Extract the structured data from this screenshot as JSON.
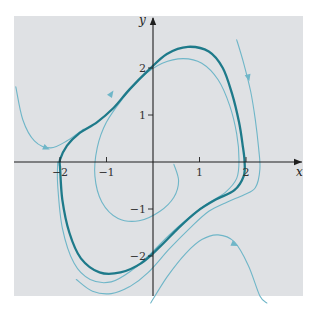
{
  "figure": {
    "type": "phase-portrait",
    "x_axis_label": "x",
    "y_axis_label": "y",
    "x_range": [
      -3,
      3.1
    ],
    "y_range": [
      -3,
      3
    ],
    "x_ticks": [
      {
        "value": -2,
        "label": "−2"
      },
      {
        "value": -1,
        "label": "−1"
      },
      {
        "value": 1,
        "label": "1"
      },
      {
        "value": 2,
        "label": "2"
      }
    ],
    "y_ticks": [
      {
        "value": 2,
        "label": "2"
      },
      {
        "value": 1,
        "label": "1"
      },
      {
        "value": -1,
        "label": "−1"
      },
      {
        "value": -2,
        "label": "−2"
      }
    ],
    "colors": {
      "background_panel": "#dfe1e4",
      "axis": "#1f1f1f",
      "limit_cycle": "#1e7a8a",
      "trajectory": "#6fb6c8"
    },
    "curves": [
      {
        "name": "limit-cycle",
        "style": "limit_cycle",
        "points": [
          [
            -2.0,
            -0.1
          ],
          [
            -2.0,
            0.05
          ],
          [
            -1.85,
            0.35
          ],
          [
            -1.6,
            0.6
          ],
          [
            -1.2,
            0.85
          ],
          [
            -0.85,
            1.15
          ],
          [
            -0.5,
            1.55
          ],
          [
            -0.1,
            1.95
          ],
          [
            0.3,
            2.3
          ],
          [
            0.75,
            2.45
          ],
          [
            1.2,
            2.35
          ],
          [
            1.5,
            2.0
          ],
          [
            1.7,
            1.45
          ],
          [
            1.85,
            0.85
          ],
          [
            1.93,
            0.35
          ],
          [
            1.97,
            0.0
          ],
          [
            1.95,
            -0.3
          ],
          [
            1.75,
            -0.6
          ],
          [
            1.35,
            -0.8
          ],
          [
            0.95,
            -1.05
          ],
          [
            0.55,
            -1.4
          ],
          [
            0.15,
            -1.8
          ],
          [
            -0.25,
            -2.15
          ],
          [
            -0.7,
            -2.35
          ],
          [
            -1.15,
            -2.35
          ],
          [
            -1.55,
            -2.05
          ],
          [
            -1.8,
            -1.5
          ],
          [
            -1.95,
            -0.8
          ],
          [
            -2.0,
            -0.1
          ]
        ]
      },
      {
        "name": "inner-spiral",
        "style": "trajectory",
        "points": [
          [
            0.45,
            -0.05
          ],
          [
            0.55,
            -0.4
          ],
          [
            0.45,
            -0.75
          ],
          [
            0.15,
            -1.05
          ],
          [
            -0.3,
            -1.25
          ],
          [
            -0.75,
            -1.2
          ],
          [
            -1.1,
            -0.85
          ],
          [
            -1.25,
            -0.3
          ],
          [
            -1.2,
            0.3
          ],
          [
            -1.0,
            0.85
          ],
          [
            -0.65,
            1.35
          ],
          [
            -0.25,
            1.8
          ],
          [
            0.2,
            2.1
          ],
          [
            0.65,
            2.2
          ],
          [
            1.05,
            2.1
          ],
          [
            1.4,
            1.75
          ],
          [
            1.65,
            1.2
          ],
          [
            1.8,
            0.6
          ],
          [
            1.85,
            0.05
          ],
          [
            1.8,
            -0.35
          ],
          [
            1.55,
            -0.65
          ],
          [
            1.15,
            -0.9
          ],
          [
            0.75,
            -1.2
          ],
          [
            0.35,
            -1.55
          ],
          [
            -0.05,
            -1.95
          ],
          [
            -0.45,
            -2.3
          ],
          [
            -0.9,
            -2.55
          ],
          [
            -1.35,
            -2.5
          ],
          [
            -1.7,
            -2.15
          ],
          [
            -1.95,
            -1.4
          ],
          [
            -2.05,
            -0.5
          ],
          [
            -2.05,
            0.0
          ]
        ],
        "arrows": [
          [
            -0.9,
            1.45
          ]
        ]
      },
      {
        "name": "outer-left-trajectory",
        "style": "trajectory",
        "points": [
          [
            -2.95,
            1.6
          ],
          [
            -2.8,
            0.9
          ],
          [
            -2.55,
            0.45
          ],
          [
            -2.2,
            0.3
          ],
          [
            -1.85,
            0.45
          ],
          [
            -1.5,
            0.7
          ]
        ],
        "arrows": [
          [
            -2.3,
            0.3
          ]
        ]
      },
      {
        "name": "outer-right-trajectory",
        "style": "trajectory",
        "points": [
          [
            1.8,
            2.6
          ],
          [
            1.95,
            2.1
          ],
          [
            2.1,
            1.5
          ],
          [
            2.2,
            0.9
          ],
          [
            2.27,
            0.3
          ],
          [
            2.3,
            -0.15
          ],
          [
            2.2,
            -0.55
          ],
          [
            1.95,
            -0.7
          ],
          [
            1.6,
            -0.85
          ],
          [
            1.2,
            -1.05
          ],
          [
            0.8,
            -1.4
          ],
          [
            0.35,
            -1.85
          ],
          [
            -0.1,
            -2.35
          ],
          [
            -0.5,
            -2.65
          ],
          [
            -0.9,
            -2.8
          ],
          [
            -1.3,
            -2.75
          ],
          [
            -1.65,
            -2.5
          ]
        ],
        "arrows": [
          [
            2.05,
            1.8
          ]
        ]
      },
      {
        "name": "lower-right-trajectory",
        "style": "trajectory",
        "points": [
          [
            -0.05,
            -3.0
          ],
          [
            0.3,
            -2.45
          ],
          [
            0.7,
            -1.95
          ],
          [
            1.05,
            -1.65
          ],
          [
            1.4,
            -1.55
          ],
          [
            1.75,
            -1.7
          ],
          [
            2.05,
            -2.2
          ],
          [
            2.3,
            -2.85
          ],
          [
            2.45,
            -3.0
          ]
        ],
        "arrows": [
          [
            1.75,
            -1.75
          ]
        ]
      }
    ]
  }
}
